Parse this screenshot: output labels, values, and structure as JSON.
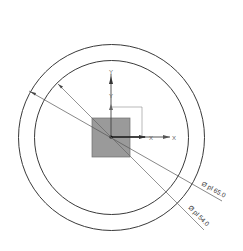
{
  "drawing": {
    "background": "#ffffff",
    "line_color": "#3a3a3a",
    "leader_color": "#555555",
    "center": {
      "x": 111,
      "y": 137
    },
    "outer_circle": {
      "radius": 93.5,
      "label": "Ø pl 65.0"
    },
    "inner_circle": {
      "radius": 77.5,
      "label": "Ø pl 54.0"
    },
    "section_square": {
      "x": 92,
      "y": 118,
      "width": 38,
      "height": 39,
      "fill": "#9a9a9a",
      "stroke": "#6e6e6e"
    },
    "axes": {
      "primary": {
        "x_label": "X",
        "y_label": "Y"
      },
      "secondary": {
        "x_label": "X",
        "y_label": "Y"
      }
    }
  }
}
